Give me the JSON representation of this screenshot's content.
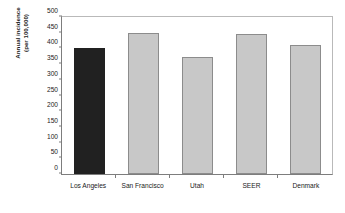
{
  "chart_data": {
    "type": "bar",
    "title": "",
    "subtitle": "",
    "xlabel": "",
    "ylabel": "Annual incidence (per 100,000)",
    "ylabel_lines": [
      "Annual incidence",
      "(per 100,000)"
    ],
    "categories": [
      "Los Angeles",
      "San Francisco",
      "Utah",
      "SEER",
      "Denmark"
    ],
    "values": [
      401,
      449,
      372,
      446,
      410
    ],
    "ylim": [
      0,
      500
    ],
    "ytick_step": 50,
    "yticks": [
      0,
      50,
      100,
      150,
      200,
      250,
      300,
      350,
      400,
      450,
      500
    ],
    "ytick_labels": [
      "0",
      "50",
      "100",
      "150",
      "200",
      "250",
      "300",
      "350",
      "400",
      "450",
      "500"
    ],
    "grid": false,
    "legend": false,
    "legend_position": "none",
    "bar_colors": [
      "#212121",
      "#c8c8c8",
      "#c8c8c8",
      "#c8c8c8",
      "#c8c8c8"
    ],
    "bar_edge_color": "#8c8c8c",
    "highlight_category": "Los Angeles",
    "axis_color": "#7d7d7d",
    "frame_color": "#b9b9b9",
    "text_color": "#1a1a1a",
    "background": "#ffffff"
  }
}
